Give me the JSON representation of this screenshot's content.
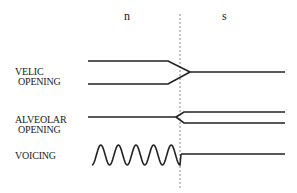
{
  "segments": [
    "n",
    "s"
  ],
  "tracks": [
    {
      "label_line1": "VELIC",
      "label_line2": "OPENING",
      "n_state": "open (two lines)",
      "s_state": "closed (single line)"
    },
    {
      "label_line1": "ALVEOLAR",
      "label_line2": "OPENING",
      "n_state": "closed (single line)",
      "s_state": "open (two lines)"
    },
    {
      "label_line1": "VOICING",
      "label_line2": "",
      "n_state": "voiced (wave)",
      "s_state": "voiceless (flat)"
    }
  ],
  "colors": {
    "line": "#222222",
    "divider": "#888888"
  }
}
